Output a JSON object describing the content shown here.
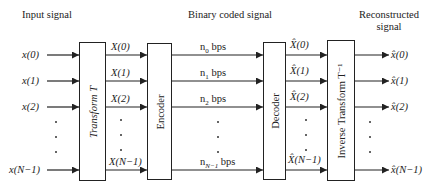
{
  "headers": {
    "input": "Input signal",
    "binary": "Binary coded signal",
    "reconstructed_line1": "Reconstructed",
    "reconstructed_line2": "signal"
  },
  "blocks": {
    "transform": "Transform T",
    "encoder": "Encoder",
    "decoder": "Decoder",
    "inverse_transform": "Inverse Transform T⁻¹"
  },
  "inputs": [
    "x(0)",
    "x(1)",
    "x(2)",
    "x(N−1)"
  ],
  "coefficients": [
    "X(0)",
    "X(1)",
    "X(2)",
    "X(N−1)"
  ],
  "bitrates": [
    {
      "n": "n",
      "sub": "0",
      "unit": " bps"
    },
    {
      "n": "n",
      "sub": "1",
      "unit": " bps"
    },
    {
      "n": "n",
      "sub": "2",
      "unit": " bps"
    },
    {
      "n": "n",
      "sub": "N−1",
      "unit": " bps"
    }
  ],
  "decoded_coefficients": [
    "X̂(0)",
    "X̂(1)",
    "X̂(2)",
    "X̂(N−1)"
  ],
  "outputs": [
    "x̂(0)",
    "x̂(1)",
    "x̂(2)",
    "x̂(N−1)"
  ],
  "colors": {
    "line": "#222222",
    "background": "#ffffff"
  }
}
